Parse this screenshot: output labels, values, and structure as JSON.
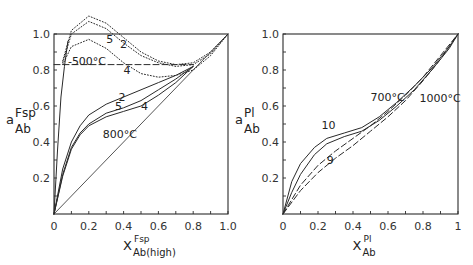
{
  "chart_data": [
    {
      "type": "line",
      "panel": "left",
      "title": "",
      "xlabel": "X^Fsp_Ab(high)",
      "xlabel_parts": {
        "main": "X",
        "sup": "Fsp",
        "sub": "Ab(high)"
      },
      "ylabel": "a^Fsp_Ab",
      "ylabel_parts": {
        "main": "a",
        "sup": "Fsp",
        "sub": "Ab"
      },
      "xlim": [
        0,
        1.0
      ],
      "ylim": [
        0,
        1.0
      ],
      "xticks": [
        "0",
        "0.2",
        "0.4",
        "0.6",
        "0.8",
        "1.0"
      ],
      "yticks": [
        "0.2",
        "0.4",
        "0.6",
        "0.8",
        "1.0"
      ],
      "grid": false,
      "annotations": [
        {
          "text": "-500°C",
          "x": 0.08,
          "y": 0.83
        },
        {
          "text": "800°C",
          "x": 0.28,
          "y": 0.42
        },
        {
          "text": "2",
          "x": 0.38,
          "y": 0.92
        },
        {
          "text": "5",
          "x": 0.3,
          "y": 0.95
        },
        {
          "text": "4",
          "x": 0.4,
          "y": 0.78
        },
        {
          "text": "2",
          "x": 0.37,
          "y": 0.63
        },
        {
          "text": "5",
          "x": 0.35,
          "y": 0.58
        },
        {
          "text": "4",
          "x": 0.5,
          "y": 0.58
        }
      ],
      "series": [
        {
          "name": "ideal (diagonal)",
          "style": "solid-thin",
          "x": [
            0,
            1.0
          ],
          "y": [
            0,
            1.0
          ]
        },
        {
          "name": "500°C model 2",
          "style": "dotted",
          "x": [
            0.05,
            0.1,
            0.2,
            0.3,
            0.4,
            0.5,
            0.6,
            0.7,
            0.8,
            0.9,
            1.0
          ],
          "y": [
            0.85,
            1.02,
            1.1,
            1.06,
            0.98,
            0.9,
            0.85,
            0.83,
            0.84,
            0.9,
            1.0
          ]
        },
        {
          "name": "500°C model 5",
          "style": "dotted",
          "x": [
            0.05,
            0.1,
            0.2,
            0.3,
            0.4,
            0.5,
            0.6,
            0.7,
            0.8,
            0.9,
            1.0
          ],
          "y": [
            0.84,
            1.0,
            1.07,
            1.03,
            0.95,
            0.88,
            0.84,
            0.82,
            0.83,
            0.89,
            1.0
          ]
        },
        {
          "name": "500°C model 4",
          "style": "dotted",
          "x": [
            0.05,
            0.1,
            0.2,
            0.3,
            0.4,
            0.5,
            0.6,
            0.7,
            0.8,
            0.9,
            1.0
          ],
          "y": [
            0.83,
            0.93,
            0.97,
            0.92,
            0.84,
            0.78,
            0.76,
            0.77,
            0.8,
            0.88,
            1.0
          ]
        },
        {
          "name": "500°C reference",
          "style": "dashed",
          "x": [
            0.0,
            0.8
          ],
          "y": [
            0.83,
            0.83
          ]
        },
        {
          "name": "800°C model 2",
          "style": "solid",
          "x": [
            0.0,
            0.05,
            0.1,
            0.15,
            0.2,
            0.3,
            0.4,
            0.5,
            0.6,
            0.7,
            0.8
          ],
          "y": [
            0.0,
            0.25,
            0.4,
            0.49,
            0.55,
            0.61,
            0.65,
            0.69,
            0.73,
            0.77,
            0.82
          ]
        },
        {
          "name": "800°C model 5",
          "style": "solid",
          "x": [
            0.0,
            0.05,
            0.1,
            0.15,
            0.2,
            0.3,
            0.4,
            0.5,
            0.6,
            0.7,
            0.8
          ],
          "y": [
            0.0,
            0.22,
            0.37,
            0.45,
            0.5,
            0.56,
            0.59,
            0.63,
            0.69,
            0.75,
            0.82
          ]
        },
        {
          "name": "800°C model 4",
          "style": "solid",
          "x": [
            0.0,
            0.05,
            0.1,
            0.15,
            0.2,
            0.3,
            0.4,
            0.5,
            0.6,
            0.7,
            0.8
          ],
          "y": [
            0.0,
            0.21,
            0.36,
            0.44,
            0.49,
            0.54,
            0.57,
            0.6,
            0.66,
            0.73,
            0.82
          ]
        },
        {
          "name": "steep limb",
          "style": "solid",
          "x": [
            0.0,
            0.02,
            0.04,
            0.06,
            0.08
          ],
          "y": [
            0.0,
            0.35,
            0.65,
            0.82,
            0.96
          ]
        }
      ]
    },
    {
      "type": "line",
      "panel": "right",
      "title": "",
      "xlabel": "X^Pl_Ab",
      "xlabel_parts": {
        "main": "X",
        "sup": "Pl",
        "sub": "Ab"
      },
      "ylabel": "a^Pl_Ab",
      "ylabel_parts": {
        "main": "a",
        "sup": "Pl",
        "sub": "Ab"
      },
      "xlim": [
        0,
        1
      ],
      "ylim": [
        0,
        1.0
      ],
      "xticks": [
        "0",
        "0.2",
        "0.4",
        "0.6",
        "0.8",
        "1"
      ],
      "yticks": [
        "0.2",
        "0.4",
        "0.6",
        "0.8",
        "1.0"
      ],
      "grid": false,
      "annotations": [
        {
          "text": "700°C",
          "x": 0.5,
          "y": 0.63
        },
        {
          "text": "1000°C",
          "x": 0.78,
          "y": 0.62
        },
        {
          "text": "10",
          "x": 0.22,
          "y": 0.47
        },
        {
          "text": "9",
          "x": 0.25,
          "y": 0.28
        }
      ],
      "series": [
        {
          "name": "700°C model 10",
          "style": "solid",
          "x": [
            0.0,
            0.05,
            0.1,
            0.18,
            0.25,
            0.35,
            0.45,
            0.55,
            0.65,
            0.75,
            0.85,
            0.95,
            1.0
          ],
          "y": [
            0.0,
            0.18,
            0.28,
            0.37,
            0.42,
            0.45,
            0.48,
            0.54,
            0.62,
            0.71,
            0.81,
            0.93,
            1.0
          ]
        },
        {
          "name": "1000°C model 10",
          "style": "solid",
          "x": [
            0.0,
            0.05,
            0.1,
            0.18,
            0.25,
            0.35,
            0.45,
            0.55,
            0.65,
            0.75,
            0.85,
            0.95,
            1.0
          ],
          "y": [
            0.0,
            0.12,
            0.22,
            0.33,
            0.39,
            0.43,
            0.46,
            0.52,
            0.6,
            0.69,
            0.8,
            0.92,
            1.0
          ]
        },
        {
          "name": "700°C model 9",
          "style": "dashed",
          "x": [
            0.0,
            0.1,
            0.2,
            0.3,
            0.4,
            0.5,
            0.6,
            0.7,
            0.8,
            0.9,
            1.0
          ],
          "y": [
            0.0,
            0.16,
            0.27,
            0.35,
            0.42,
            0.49,
            0.57,
            0.66,
            0.76,
            0.88,
            1.0
          ]
        },
        {
          "name": "1000°C model 9",
          "style": "dashed",
          "x": [
            0.0,
            0.1,
            0.2,
            0.3,
            0.4,
            0.5,
            0.6,
            0.7,
            0.8,
            0.9,
            1.0
          ],
          "y": [
            0.0,
            0.13,
            0.23,
            0.31,
            0.38,
            0.46,
            0.54,
            0.63,
            0.74,
            0.86,
            1.0
          ]
        }
      ]
    }
  ]
}
